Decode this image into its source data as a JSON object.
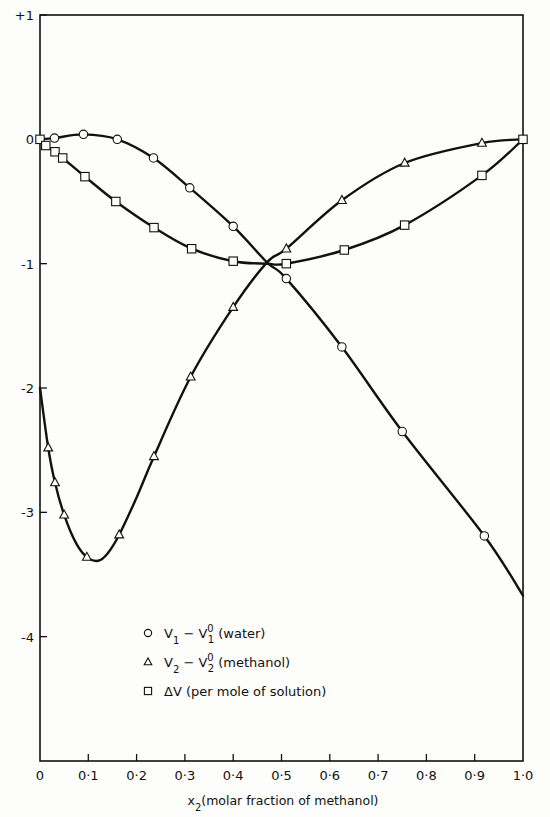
{
  "chart_data": {
    "type": "line",
    "title": "",
    "xlabel": "x2 (molar fraction of methanol)",
    "ylabel": "",
    "xlim": [
      0,
      1.0
    ],
    "ylim": [
      -5,
      1
    ],
    "x_ticks": [
      "0",
      "0·1",
      "0·2",
      "0·3",
      "0·4",
      "0·5",
      "0·6",
      "0·7",
      "0·8",
      "0·9",
      "1·0"
    ],
    "y_ticks": [
      "+1",
      "0",
      "-1",
      "-2",
      "-3",
      "-4"
    ],
    "grid": false,
    "legend_position": "lower-left inside",
    "series": [
      {
        "name": "V1 − V1⁰ (water)",
        "marker": "circle",
        "points": [
          [
            0.03,
            0.01
          ],
          [
            0.09,
            0.04
          ],
          [
            0.16,
            0.0
          ],
          [
            0.235,
            -0.15
          ],
          [
            0.31,
            -0.39
          ],
          [
            0.4,
            -0.7
          ],
          [
            0.51,
            -1.12
          ],
          [
            0.625,
            -1.67
          ],
          [
            0.75,
            -2.35
          ],
          [
            0.92,
            -3.19
          ]
        ],
        "curve": [
          [
            0.0,
            0.0
          ],
          [
            0.03,
            0.01
          ],
          [
            0.09,
            0.04
          ],
          [
            0.16,
            0.0
          ],
          [
            0.235,
            -0.15
          ],
          [
            0.31,
            -0.39
          ],
          [
            0.4,
            -0.7
          ],
          [
            0.47,
            -0.99
          ],
          [
            0.51,
            -1.12
          ],
          [
            0.625,
            -1.67
          ],
          [
            0.75,
            -2.35
          ],
          [
            0.92,
            -3.19
          ],
          [
            1.0,
            -3.67
          ]
        ]
      },
      {
        "name": "V2 − V2⁰ (methanol)",
        "marker": "triangle",
        "points": [
          [
            0.017,
            -2.48
          ],
          [
            0.031,
            -2.76
          ],
          [
            0.05,
            -3.02
          ],
          [
            0.097,
            -3.36
          ],
          [
            0.164,
            -3.18
          ],
          [
            0.236,
            -2.55
          ],
          [
            0.312,
            -1.91
          ],
          [
            0.4,
            -1.35
          ],
          [
            0.51,
            -0.88
          ],
          [
            0.625,
            -0.49
          ],
          [
            0.755,
            -0.19
          ],
          [
            0.915,
            -0.03
          ]
        ],
        "curve": [
          [
            0.0,
            -2.0
          ],
          [
            0.017,
            -2.48
          ],
          [
            0.031,
            -2.76
          ],
          [
            0.05,
            -3.02
          ],
          [
            0.075,
            -3.25
          ],
          [
            0.097,
            -3.36
          ],
          [
            0.12,
            -3.39
          ],
          [
            0.14,
            -3.33
          ],
          [
            0.164,
            -3.18
          ],
          [
            0.2,
            -2.88
          ],
          [
            0.236,
            -2.55
          ],
          [
            0.312,
            -1.91
          ],
          [
            0.4,
            -1.35
          ],
          [
            0.47,
            -0.99
          ],
          [
            0.51,
            -0.88
          ],
          [
            0.625,
            -0.49
          ],
          [
            0.755,
            -0.19
          ],
          [
            0.915,
            -0.03
          ],
          [
            1.0,
            0.0
          ]
        ]
      },
      {
        "name": "ΔV (per mole of solution)",
        "marker": "square",
        "points": [
          [
            0.0,
            0.0
          ],
          [
            0.012,
            -0.05
          ],
          [
            0.031,
            -0.1
          ],
          [
            0.047,
            -0.15
          ],
          [
            0.093,
            -0.3
          ],
          [
            0.157,
            -0.5
          ],
          [
            0.236,
            -0.71
          ],
          [
            0.314,
            -0.88
          ],
          [
            0.4,
            -0.98
          ],
          [
            0.51,
            -1.0
          ],
          [
            0.63,
            -0.89
          ],
          [
            0.755,
            -0.69
          ],
          [
            0.915,
            -0.29
          ],
          [
            1.0,
            0.0
          ]
        ],
        "curve": [
          [
            0.0,
            0.0
          ],
          [
            0.012,
            -0.05
          ],
          [
            0.031,
            -0.1
          ],
          [
            0.047,
            -0.15
          ],
          [
            0.093,
            -0.3
          ],
          [
            0.157,
            -0.5
          ],
          [
            0.236,
            -0.71
          ],
          [
            0.314,
            -0.88
          ],
          [
            0.4,
            -0.98
          ],
          [
            0.47,
            -1.0
          ],
          [
            0.51,
            -1.0
          ],
          [
            0.63,
            -0.89
          ],
          [
            0.755,
            -0.69
          ],
          [
            0.915,
            -0.29
          ],
          [
            1.0,
            0.0
          ]
        ]
      }
    ]
  },
  "legend": {
    "items": [
      {
        "symbol": "circle",
        "label_main": "V",
        "sub1": "1",
        "mid": " − V",
        "sub2": "1",
        "sup": "0",
        "tail": " (water)"
      },
      {
        "symbol": "triangle",
        "label_main": "V",
        "sub1": "2",
        "mid": " − V",
        "sub2": "2",
        "sup": "0",
        "tail": " (methanol)"
      },
      {
        "symbol": "square",
        "label_main": "ΔV",
        "sub1": "",
        "mid": "",
        "sub2": "",
        "sup": "",
        "tail": " (per mole of solution)"
      }
    ]
  },
  "axis_title": {
    "x_var": "x",
    "x_sub": "2",
    "x_desc": "(molar fraction of methanol)"
  },
  "colors": {
    "ink": "#111111",
    "paper": "#fdfdfb"
  }
}
